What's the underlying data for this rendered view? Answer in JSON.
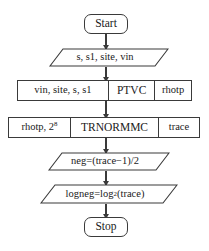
{
  "diagram": {
    "type": "flowchart",
    "orientation": "top-to-bottom",
    "title": "",
    "style": {
      "line_color": "#3a3a3a",
      "text_color": "#1a1a1a",
      "background": "#ffffff"
    },
    "nodes": {
      "start": {
        "label": "Start",
        "shape": "terminal"
      },
      "input_params": {
        "label": "s, s1, site, vin",
        "shape": "parallelogram"
      },
      "ptvc_row": {
        "shape": "process-row",
        "inputs": "vin, site, s, s1",
        "process": "PTVC",
        "outputs": "rhotp"
      },
      "trnormmc_row": {
        "shape": "process-row",
        "inputs_prefix": "rhotp, 2",
        "inputs_exponent": "8",
        "process": "TRNORMMC",
        "outputs": "trace"
      },
      "neg_calc": {
        "label": "neg=(trace−1)/2",
        "shape": "parallelogram"
      },
      "logneg_calc": {
        "prefix": "logneg=log",
        "subscript": "2",
        "suffix": "(trace)",
        "shape": "parallelogram"
      },
      "stop": {
        "label": "Stop",
        "shape": "terminal"
      }
    },
    "connectors": [
      {
        "from": "start",
        "to": "input_params",
        "arrow": "down"
      },
      {
        "from": "input_params",
        "to": "ptvc_row",
        "arrow": "down"
      },
      {
        "from": "ptvc_row",
        "to": "trnormmc_row",
        "arrow": "down"
      },
      {
        "from": "trnormmc_row",
        "to": "neg_calc",
        "arrow": "down"
      },
      {
        "from": "neg_calc",
        "to": "logneg_calc",
        "arrow": "down"
      },
      {
        "from": "logneg_calc",
        "to": "stop",
        "arrow": "down"
      }
    ]
  }
}
